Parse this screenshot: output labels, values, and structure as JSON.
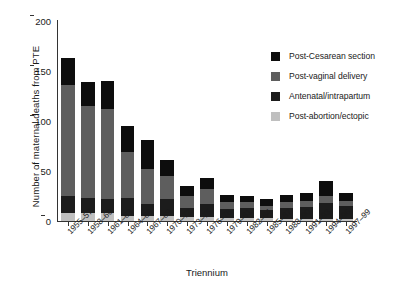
{
  "chart_data": {
    "type": "bar",
    "subtype": "stacked-bar",
    "title": "",
    "xlabel": "Triennium",
    "ylabel": "Number of maternal deaths from PTE",
    "ylim": [
      0,
      200
    ],
    "yticks": [
      0,
      50,
      100,
      150,
      200
    ],
    "grid": false,
    "legend_position": "upper right",
    "categories": [
      "1955–57",
      "1958–60",
      "1961–63",
      "1964–66",
      "1967–69",
      "1970–72",
      "1973–75",
      "1976–78",
      "1979–81",
      "1982–84",
      "1985–87",
      "1988–90",
      "1991–93",
      "1994–96",
      "1997–99"
    ],
    "series": [
      {
        "name": "Post-abortion/ectopic",
        "color": "#bfbfbf",
        "values": [
          8,
          8,
          8,
          5,
          5,
          5,
          4,
          4,
          3,
          3,
          3,
          2,
          2,
          2,
          2
        ]
      },
      {
        "name": "Antenatal/intrapartum",
        "color": "#1c1c1c",
        "values": [
          17,
          15,
          14,
          18,
          12,
          17,
          9,
          13,
          9,
          10,
          8,
          11,
          12,
          16,
          13
        ]
      },
      {
        "name": "Post-vaginal delivery",
        "color": "#5e5e5e",
        "values": [
          111,
          92,
          90,
          46,
          35,
          23,
          12,
          15,
          7,
          6,
          4,
          6,
          6,
          7,
          5
        ]
      },
      {
        "name": "Post-Cesarean section",
        "color": "#0d0d0d",
        "values": [
          27,
          24,
          28,
          26,
          29,
          16,
          10,
          11,
          7,
          6,
          7,
          7,
          8,
          15,
          8
        ]
      }
    ],
    "totals": [
      163,
      139,
      140,
      95,
      81,
      61,
      35,
      43,
      26,
      25,
      22,
      26,
      28,
      40,
      28
    ]
  },
  "legend": {
    "items": [
      {
        "label": "Post-Cesarean section",
        "color": "#0d0d0d"
      },
      {
        "label": "Post-vaginal delivery",
        "color": "#5e5e5e"
      },
      {
        "label": "Antenatal/intrapartum",
        "color": "#1c1c1c"
      },
      {
        "label": "Post-abortion/ectopic",
        "color": "#bfbfbf"
      }
    ]
  }
}
